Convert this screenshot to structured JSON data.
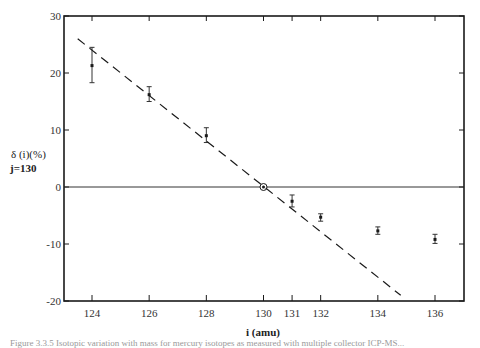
{
  "chart_data": {
    "type": "scatter",
    "title": "",
    "xlabel": "i (amu)",
    "ylabel": "δ (i)(%)",
    "ylabel_sub": "j=130",
    "xlim": [
      123.0,
      137.0
    ],
    "ylim": [
      -20,
      30
    ],
    "x_ticks": [
      124,
      126,
      128,
      130,
      131,
      132,
      134,
      136
    ],
    "x_tick_labels": [
      "124",
      "126",
      "128",
      "130",
      "131",
      "132",
      "134",
      "136"
    ],
    "y_ticks": [
      -20,
      -10,
      0,
      10,
      20,
      30
    ],
    "y_tick_labels": [
      "-20",
      "-10",
      "0",
      "10",
      "20",
      "30"
    ],
    "grid": false,
    "legend": null,
    "series": [
      {
        "name": "measured",
        "marker": "square-with-errorbars",
        "x": [
          124,
          126,
          128,
          131,
          132,
          134,
          136
        ],
        "y": [
          21.3,
          16.2,
          9.0,
          -2.5,
          -5.3,
          -7.7,
          -9.2
        ],
        "err_low": [
          18.3,
          15.0,
          7.8,
          -3.5,
          -6.0,
          -8.3,
          -9.9
        ],
        "err_high": [
          24.5,
          17.6,
          10.4,
          -1.4,
          -4.7,
          -7.0,
          -8.3
        ]
      },
      {
        "name": "reference",
        "marker": "circled-dot",
        "x": [
          130
        ],
        "y": [
          0
        ]
      },
      {
        "name": "linear-trend",
        "style": "dashed",
        "x": [
          123.5,
          134.8
        ],
        "y": [
          26.0,
          -19.0
        ]
      }
    ],
    "reference_line": {
      "y": 0,
      "style": "solid"
    }
  },
  "caption": "Figure 3.3.5 Isotopic variation with mass for mercury isotopes as measured with multiple collector ICP-MS..."
}
